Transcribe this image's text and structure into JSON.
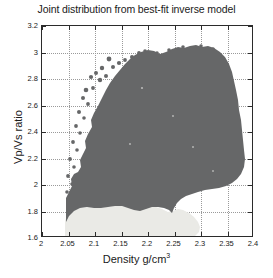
{
  "chart_data": {
    "type": "scatter",
    "title": "Joint distribution from best-fit inverse model",
    "xlabel": "Density g/cm",
    "xlabel_sup": "3",
    "ylabel": "Vp/Vs ratio",
    "xlim": [
      2,
      2.4
    ],
    "ylim": [
      1.6,
      3.2
    ],
    "xticks": [
      2,
      2.05,
      2.1,
      2.15,
      2.2,
      2.25,
      2.3,
      2.35,
      2.4
    ],
    "xticklabels": [
      "2",
      "2.05",
      "2.1",
      "2.15",
      "2.2",
      "2.25",
      "2.3",
      "2.35",
      "2.4"
    ],
    "yticks": [
      1.6,
      1.8,
      2.0,
      2.2,
      2.4,
      2.6,
      2.8,
      3.0,
      3.2
    ],
    "yticklabels": [
      "1.6",
      "1.8",
      "2",
      "2.2",
      "2.4",
      "2.6",
      "2.8",
      "3",
      "3.2"
    ],
    "grid": true,
    "legend": null,
    "series": [
      {
        "name": "high-density joint distribution",
        "color": "#666768",
        "description": "Dense dark-gray point cloud of Vp/Vs ratio versus density samples",
        "x_range": [
          2.045,
          2.395
        ],
        "y_range": [
          1.93,
          3.03
        ],
        "peak_y": 3.03,
        "peak_x": 2.095,
        "n_points_approx": 20000
      },
      {
        "name": "low Vp/Vs tail",
        "color": "#eaeae6",
        "description": "Light cream point cloud below the main cloud at low Vp/Vs ratio",
        "x_range": [
          2.043,
          2.2
        ],
        "y_range": [
          1.78,
          2.0
        ],
        "n_points_approx": 6000
      }
    ],
    "annotations": []
  }
}
